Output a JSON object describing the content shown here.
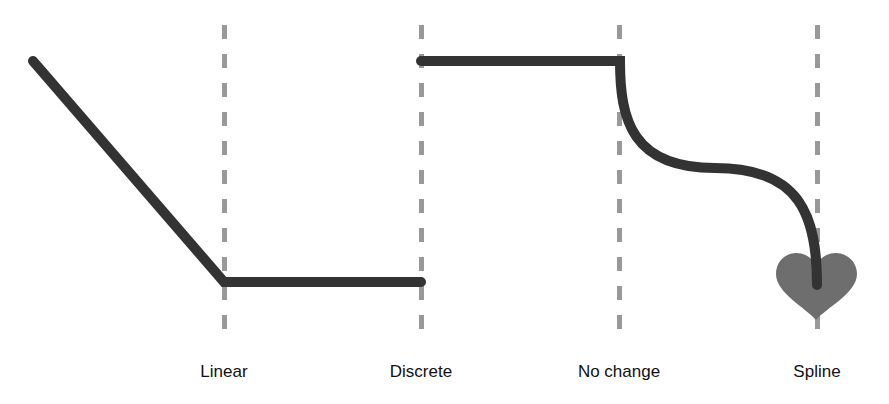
{
  "diagram": {
    "colors": {
      "background": "#ffffff",
      "curve": "#333333",
      "guide": "#999999",
      "heart": "#6e6e6e",
      "label": "#111111"
    },
    "keyframes": [
      {
        "label": "Linear",
        "x": 224
      },
      {
        "label": "Discrete",
        "x": 421
      },
      {
        "label": "No change",
        "x": 619
      },
      {
        "label": "Spline",
        "x": 817
      }
    ],
    "segments": [
      {
        "type": "linear",
        "from": [
          33,
          61
        ],
        "to": [
          224,
          282
        ]
      },
      {
        "type": "hold",
        "from": [
          224,
          282
        ],
        "to": [
          421,
          282
        ]
      },
      {
        "type": "discrete-jump",
        "from": [
          421,
          61
        ],
        "to": [
          620,
          61
        ]
      },
      {
        "type": "spline",
        "from": [
          620,
          61
        ],
        "to": [
          817,
          285
        ]
      }
    ],
    "end_marker": {
      "shape": "heart",
      "x": 816,
      "y": 285
    }
  },
  "labels": {
    "linear": "Linear",
    "discrete": "Discrete",
    "no_change": "No change",
    "spline": "Spline"
  }
}
